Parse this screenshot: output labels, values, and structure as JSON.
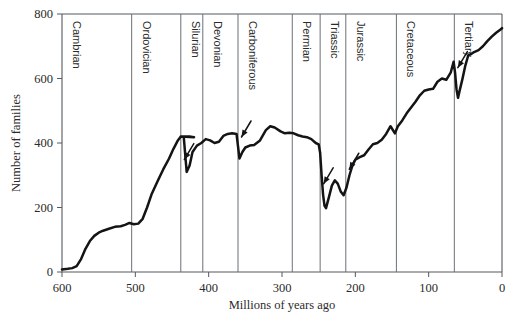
{
  "chart_data": {
    "type": "line",
    "title": "",
    "xlabel": "Millions of years ago",
    "ylabel": "Number of families",
    "xlim": [
      600,
      0
    ],
    "ylim": [
      0,
      800
    ],
    "x_ticks": [
      600,
      500,
      400,
      300,
      200,
      100,
      0
    ],
    "y_ticks": [
      0,
      200,
      400,
      600,
      800
    ],
    "x_reversed": true,
    "grid": false,
    "legend": "none",
    "series": [
      {
        "name": "Marine family diversity",
        "points": [
          [
            600,
            8
          ],
          [
            592,
            10
          ],
          [
            586,
            12
          ],
          [
            580,
            18
          ],
          [
            574,
            40
          ],
          [
            568,
            72
          ],
          [
            562,
            96
          ],
          [
            556,
            112
          ],
          [
            550,
            122
          ],
          [
            544,
            128
          ],
          [
            536,
            134
          ],
          [
            528,
            140
          ],
          [
            520,
            142
          ],
          [
            514,
            146
          ],
          [
            508,
            152
          ],
          [
            502,
            148
          ],
          [
            496,
            150
          ],
          [
            490,
            165
          ],
          [
            484,
            200
          ],
          [
            478,
            240
          ],
          [
            470,
            280
          ],
          [
            462,
            318
          ],
          [
            454,
            352
          ],
          [
            448,
            382
          ],
          [
            442,
            408
          ],
          [
            438,
            420
          ],
          [
            432,
            420
          ],
          [
            426,
            420
          ],
          [
            420,
            418
          ],
          [
            438,
            420
          ],
          [
            434,
            420
          ],
          [
            430,
            310
          ],
          [
            426,
            330
          ],
          [
            422,
            372
          ],
          [
            416,
            392
          ],
          [
            410,
            400
          ],
          [
            404,
            412
          ],
          [
            398,
            408
          ],
          [
            392,
            400
          ],
          [
            386,
            404
          ],
          [
            380,
            422
          ],
          [
            374,
            428
          ],
          [
            368,
            430
          ],
          [
            362,
            428
          ],
          [
            358,
            352
          ],
          [
            354,
            372
          ],
          [
            350,
            386
          ],
          [
            344,
            392
          ],
          [
            338,
            394
          ],
          [
            330,
            408
          ],
          [
            322,
            440
          ],
          [
            316,
            452
          ],
          [
            310,
            448
          ],
          [
            302,
            436
          ],
          [
            296,
            430
          ],
          [
            290,
            432
          ],
          [
            284,
            430
          ],
          [
            278,
            424
          ],
          [
            272,
            420
          ],
          [
            266,
            418
          ],
          [
            260,
            412
          ],
          [
            254,
            400
          ],
          [
            250,
            396
          ],
          [
            248,
            370
          ],
          [
            246,
            300
          ],
          [
            244,
            240
          ],
          [
            242,
            205
          ],
          [
            240,
            198
          ],
          [
            236,
            232
          ],
          [
            232,
            268
          ],
          [
            228,
            284
          ],
          [
            224,
            274
          ],
          [
            220,
            250
          ],
          [
            216,
            238
          ],
          [
            212,
            262
          ],
          [
            208,
            300
          ],
          [
            204,
            330
          ],
          [
            200,
            348
          ],
          [
            194,
            356
          ],
          [
            188,
            362
          ],
          [
            182,
            380
          ],
          [
            176,
            396
          ],
          [
            170,
            400
          ],
          [
            164,
            410
          ],
          [
            158,
            428
          ],
          [
            152,
            452
          ],
          [
            146,
            430
          ],
          [
            142,
            452
          ],
          [
            136,
            470
          ],
          [
            130,
            492
          ],
          [
            124,
            510
          ],
          [
            118,
            528
          ],
          [
            112,
            548
          ],
          [
            106,
            562
          ],
          [
            100,
            566
          ],
          [
            94,
            568
          ],
          [
            88,
            590
          ],
          [
            82,
            600
          ],
          [
            76,
            596
          ],
          [
            70,
            618
          ],
          [
            66,
            652
          ],
          [
            64,
            618
          ],
          [
            62,
            566
          ],
          [
            60,
            540
          ],
          [
            58,
            560
          ],
          [
            54,
            598
          ],
          [
            50,
            640
          ],
          [
            46,
            672
          ],
          [
            42,
            676
          ],
          [
            38,
            682
          ],
          [
            32,
            688
          ],
          [
            26,
            700
          ],
          [
            20,
            716
          ],
          [
            14,
            730
          ],
          [
            8,
            742
          ],
          [
            2,
            752
          ],
          [
            0,
            756
          ]
        ]
      }
    ],
    "periods": [
      {
        "name": "Cambrian",
        "start": 600,
        "end": 505
      },
      {
        "name": "Ordovician",
        "start": 505,
        "end": 438
      },
      {
        "name": "Silurian",
        "start": 438,
        "end": 408
      },
      {
        "name": "Devonian",
        "start": 408,
        "end": 360
      },
      {
        "name": "Carboniferous",
        "start": 360,
        "end": 286
      },
      {
        "name": "Permian",
        "start": 286,
        "end": 248
      },
      {
        "name": "Triassic",
        "start": 248,
        "end": 213
      },
      {
        "name": "Jurassic",
        "start": 213,
        "end": 144
      },
      {
        "name": "Cretaceous",
        "start": 144,
        "end": 65
      },
      {
        "name": "Tertiary",
        "start": 65,
        "end": 0
      }
    ],
    "annotations": [
      {
        "name": "end-Ordovician-extinction",
        "x": 438,
        "y": 330
      },
      {
        "name": "late-Devonian-extinction",
        "x": 360,
        "y": 400
      },
      {
        "name": "end-Permian-extinction",
        "x": 248,
        "y": 255
      },
      {
        "name": "end-Triassic-extinction",
        "x": 213,
        "y": 300
      },
      {
        "name": "end-Cretaceous-extinction",
        "x": 65,
        "y": 615
      }
    ],
    "colors": {
      "curve": "#141414",
      "axis": "#555a5e",
      "period_divider": "#6b7074",
      "background": "#ffffff"
    }
  }
}
